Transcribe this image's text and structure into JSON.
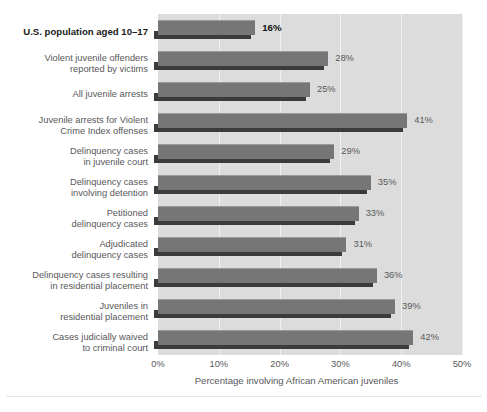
{
  "chart_data": {
    "type": "bar",
    "orientation": "horizontal",
    "title": "",
    "xlabel": "Percentage involving African American juveniles",
    "ylabel": "",
    "xlim": [
      0,
      50
    ],
    "xticks": [
      "0%",
      "10%",
      "20%",
      "30%",
      "40%",
      "50%"
    ],
    "xtick_values": [
      0,
      10,
      20,
      30,
      40,
      50
    ],
    "grid": "vertical",
    "legend": "none",
    "value_suffix": "%",
    "categories": [
      "U.S. population aged 10–17",
      "Violent juvenile offenders\nreported by victims",
      "All juvenile arrests",
      "Juvenile arrests for Violent\nCrime Index offenses",
      "Delinquency cases\nin juvenile court",
      "Delinquency cases\ninvolving detention",
      "Petitioned\ndelinquency cases",
      "Adjudicated\ndelinquency cases",
      "Delinquency cases resulting\nin residential placement",
      "Juveniles in\nresidential placement",
      "Cases judicially waived\nto criminal court"
    ],
    "values": [
      16,
      28,
      25,
      41,
      29,
      35,
      33,
      31,
      36,
      39,
      42
    ],
    "value_labels": [
      "16%",
      "28%",
      "25%",
      "41%",
      "29%",
      "35%",
      "33%",
      "31%",
      "36%",
      "39%",
      "42%"
    ],
    "emphasized_index": 0,
    "colors": {
      "plot_background": "#dcdcdc",
      "page_background": "#ffffff",
      "bar_face": "#767676",
      "bar_highlight": "#9a9a9a",
      "bar_shadow": "#3b3b3b",
      "gridline": "#f1f1f1",
      "label_text": "#58585a",
      "emphasis_text": "#111111"
    }
  }
}
